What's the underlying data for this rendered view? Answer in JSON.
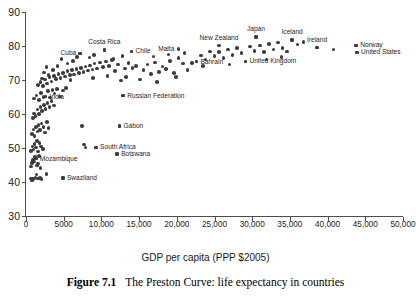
{
  "chart_data": {
    "type": "scatter",
    "title": "",
    "xlabel": "GDP per capita (PPP $2005)",
    "ylabel": "",
    "xlim": [
      0,
      50000
    ],
    "ylim": [
      30,
      90
    ],
    "grid": false,
    "legend": "none",
    "xticks": [
      0,
      5000,
      10000,
      15000,
      20000,
      25000,
      30000,
      35000,
      40000,
      45000,
      50000
    ],
    "xticklabels": [
      "0",
      "5000",
      "10,000",
      "15,000",
      "20,000",
      "25,000",
      "30,000",
      "35,000",
      "40,000",
      "45,000",
      "50,000"
    ],
    "yticks": [
      30,
      40,
      50,
      60,
      70,
      80,
      90
    ],
    "yticklabels": [
      "30",
      "40",
      "50",
      "60",
      "70",
      "80",
      "90"
    ],
    "series_name": "countries",
    "annotations": [
      {
        "label": "Cuba",
        "x": 7200,
        "y": 77.8,
        "pos": "left"
      },
      {
        "label": "Costa Rica",
        "x": 10400,
        "y": 78.8,
        "pos": "above"
      },
      {
        "label": "Chile",
        "x": 14000,
        "y": 78.4,
        "pos": "right"
      },
      {
        "label": "Malta",
        "x": 20200,
        "y": 79.1,
        "pos": "left"
      },
      {
        "label": "New Zealand",
        "x": 25600,
        "y": 80.1,
        "pos": "above"
      },
      {
        "label": "Japan",
        "x": 30500,
        "y": 82.6,
        "pos": "above"
      },
      {
        "label": "Iceland",
        "x": 35300,
        "y": 81.8,
        "pos": "above"
      },
      {
        "label": "Ireland",
        "x": 38600,
        "y": 79.5,
        "pos": "above"
      },
      {
        "label": "Norway",
        "x": 43800,
        "y": 80.2,
        "pos": "right"
      },
      {
        "label": "United States",
        "x": 43900,
        "y": 78.1,
        "pos": "right"
      },
      {
        "label": "Bahrain",
        "x": 22600,
        "y": 75.4,
        "pos": "right"
      },
      {
        "label": "United Kingdom",
        "x": 29100,
        "y": 75.5,
        "pos": "right"
      },
      {
        "label": "India",
        "x": 2600,
        "y": 65.1,
        "pos": "right"
      },
      {
        "label": "Russian Federation",
        "x": 12900,
        "y": 65.4,
        "pos": "right"
      },
      {
        "label": "Gabon",
        "x": 12400,
        "y": 56.5,
        "pos": "right"
      },
      {
        "label": "South Africa",
        "x": 9300,
        "y": 50.2,
        "pos": "right"
      },
      {
        "label": "Botswana",
        "x": 12100,
        "y": 48.2,
        "pos": "right"
      },
      {
        "label": "Mozambique",
        "x": 1300,
        "y": 46.9,
        "pos": "right"
      },
      {
        "label": "Swaziland",
        "x": 4900,
        "y": 41.2,
        "pos": "right"
      }
    ],
    "points": [
      [
        680,
        41.0
      ],
      [
        780,
        40.5
      ],
      [
        900,
        40.8
      ],
      [
        1050,
        41.0
      ],
      [
        1250,
        41.3
      ],
      [
        1400,
        42.2
      ],
      [
        1600,
        41.0
      ],
      [
        1850,
        41.1
      ],
      [
        2050,
        40.8
      ],
      [
        2700,
        42.4
      ],
      [
        4900,
        41.2
      ],
      [
        700,
        44.6
      ],
      [
        820,
        45.6
      ],
      [
        950,
        46.5
      ],
      [
        1080,
        46.0
      ],
      [
        1180,
        47.3
      ],
      [
        1300,
        46.9
      ],
      [
        1450,
        44.8
      ],
      [
        1560,
        45.4
      ],
      [
        1700,
        47.7
      ],
      [
        1900,
        44.2
      ],
      [
        700,
        49.2
      ],
      [
        850,
        50.4
      ],
      [
        980,
        49.6
      ],
      [
        1150,
        51.2
      ],
      [
        1320,
        50.1
      ],
      [
        1480,
        52.0
      ],
      [
        1620,
        49.0
      ],
      [
        1800,
        51.4
      ],
      [
        2000,
        50.5
      ],
      [
        2250,
        49.7
      ],
      [
        7700,
        51.0
      ],
      [
        7900,
        50.1
      ],
      [
        9300,
        50.2
      ],
      [
        12100,
        48.2
      ],
      [
        800,
        54.2
      ],
      [
        980,
        55.4
      ],
      [
        1150,
        53.6
      ],
      [
        1330,
        56.1
      ],
      [
        1500,
        54.8
      ],
      [
        1680,
        56.8
      ],
      [
        1850,
        55.3
      ],
      [
        2050,
        57.2
      ],
      [
        2300,
        56.2
      ],
      [
        2500,
        54.5
      ],
      [
        2750,
        57.6
      ],
      [
        3000,
        55.8
      ],
      [
        12400,
        56.5
      ],
      [
        7400,
        56.4
      ],
      [
        900,
        58.8
      ],
      [
        1100,
        60.1
      ],
      [
        1280,
        59.4
      ],
      [
        1500,
        61.3
      ],
      [
        1700,
        60.0
      ],
      [
        1900,
        62.0
      ],
      [
        2100,
        60.8
      ],
      [
        2350,
        62.6
      ],
      [
        2600,
        61.5
      ],
      [
        2850,
        63.2
      ],
      [
        3100,
        62.0
      ],
      [
        3400,
        63.8
      ],
      [
        3700,
        62.5
      ],
      [
        1100,
        64.6
      ],
      [
        1400,
        65.5
      ],
      [
        1700,
        64.2
      ],
      [
        2000,
        66.1
      ],
      [
        2300,
        65.0
      ],
      [
        2600,
        65.1
      ],
      [
        2900,
        66.8
      ],
      [
        3200,
        64.9
      ],
      [
        3500,
        67.1
      ],
      [
        3800,
        66.0
      ],
      [
        4100,
        67.4
      ],
      [
        4500,
        65.2
      ],
      [
        4900,
        66.9
      ],
      [
        5300,
        67.6
      ],
      [
        12900,
        65.4
      ],
      [
        1600,
        68.5
      ],
      [
        1950,
        69.4
      ],
      [
        2250,
        68.2
      ],
      [
        2550,
        70.1
      ],
      [
        2800,
        69.0
      ],
      [
        3100,
        70.8
      ],
      [
        3400,
        69.6
      ],
      [
        3700,
        71.2
      ],
      [
        4000,
        70.3
      ],
      [
        4300,
        71.8
      ],
      [
        4600,
        70.6
      ],
      [
        4900,
        72.1
      ],
      [
        5200,
        71.0
      ],
      [
        5500,
        72.6
      ],
      [
        5800,
        71.4
      ],
      [
        6100,
        72.9
      ],
      [
        6400,
        71.6
      ],
      [
        6700,
        73.2
      ],
      [
        7000,
        72.0
      ],
      [
        7300,
        73.6
      ],
      [
        7600,
        72.3
      ],
      [
        7900,
        74.0
      ],
      [
        8200,
        72.8
      ],
      [
        8500,
        74.3
      ],
      [
        8800,
        73.1
      ],
      [
        9100,
        74.8
      ],
      [
        9400,
        73.4
      ],
      [
        9800,
        75.1
      ],
      [
        10200,
        73.8
      ],
      [
        10600,
        75.4
      ],
      [
        11000,
        74.1
      ],
      [
        11400,
        75.8
      ],
      [
        11800,
        72.6
      ],
      [
        12200,
        74.5
      ],
      [
        12600,
        69.8
      ],
      [
        13100,
        73.4
      ],
      [
        13600,
        75.0
      ],
      [
        14100,
        73.6
      ],
      [
        14600,
        74.2
      ],
      [
        15100,
        70.2
      ],
      [
        15600,
        73.0
      ],
      [
        16100,
        74.6
      ],
      [
        16600,
        71.8
      ],
      [
        17100,
        75.2
      ],
      [
        17600,
        72.4
      ],
      [
        18100,
        74.0
      ],
      [
        18600,
        73.2
      ],
      [
        19100,
        75.6
      ],
      [
        19600,
        72.0
      ],
      [
        20200,
        76.4
      ],
      [
        20800,
        74.8
      ],
      [
        21400,
        73.0
      ],
      [
        22000,
        75.0
      ],
      [
        22600,
        75.4
      ],
      [
        23200,
        77.2
      ],
      [
        23800,
        76.0
      ],
      [
        24400,
        78.4
      ],
      [
        25000,
        77.0
      ],
      [
        25600,
        78.2
      ],
      [
        26200,
        76.4
      ],
      [
        26800,
        79.0
      ],
      [
        27400,
        77.4
      ],
      [
        28000,
        79.4
      ],
      [
        28600,
        78.0
      ],
      [
        29100,
        75.5
      ],
      [
        29700,
        79.8
      ],
      [
        30300,
        78.6
      ],
      [
        30500,
        82.6
      ],
      [
        31000,
        80.2
      ],
      [
        31600,
        78.2
      ],
      [
        32200,
        80.6
      ],
      [
        32800,
        79.0
      ],
      [
        33400,
        81.0
      ],
      [
        34000,
        79.4
      ],
      [
        34600,
        78.4
      ],
      [
        35300,
        81.8
      ],
      [
        36000,
        80.4
      ],
      [
        36800,
        81.2
      ],
      [
        38600,
        79.5
      ],
      [
        40800,
        79.0
      ],
      [
        43800,
        80.2
      ],
      [
        43900,
        78.1
      ],
      [
        7200,
        77.8
      ],
      [
        10400,
        78.8
      ],
      [
        14000,
        78.4
      ],
      [
        8400,
        76.6
      ],
      [
        9000,
        77.4
      ],
      [
        5500,
        74.8
      ],
      [
        6200,
        75.6
      ],
      [
        4200,
        74.2
      ],
      [
        3600,
        73.0
      ],
      [
        3000,
        71.4
      ],
      [
        2400,
        72.2
      ],
      [
        4700,
        76.2
      ],
      [
        6800,
        76.8
      ],
      [
        11600,
        76.2
      ],
      [
        12800,
        77.0
      ],
      [
        2100,
        70.4
      ],
      [
        2700,
        73.8
      ],
      [
        5900,
        70.0
      ],
      [
        8900,
        70.6
      ],
      [
        10800,
        71.2
      ],
      [
        16900,
        76.9
      ],
      [
        18900,
        77.5
      ],
      [
        21000,
        78.0
      ],
      [
        13300,
        70.8
      ],
      [
        17400,
        69.4
      ],
      [
        19900,
        70.8
      ],
      [
        23500,
        74.2
      ],
      [
        27000,
        74.6
      ],
      [
        31900,
        76.0
      ],
      [
        33900,
        76.8
      ]
    ]
  },
  "axis_title": "GDP per capita (PPP $2005)",
  "caption": {
    "figure_number": "Figure 7.1",
    "text": "The Preston Curve: life expectancy in countries"
  }
}
